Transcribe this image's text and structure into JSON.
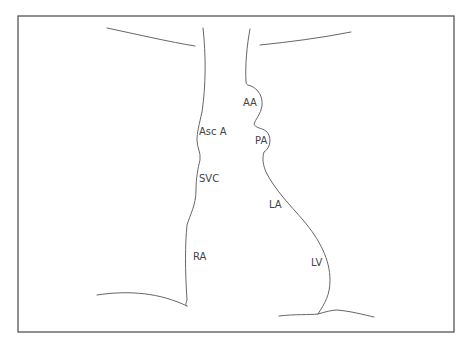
{
  "diagram": {
    "type": "cardiac silhouette outline (chest radiograph schematic)",
    "colors": {
      "line": "#666666",
      "frame": "#555555",
      "text": "#444444",
      "background": "#ffffff"
    },
    "labels": [
      {
        "id": "aa",
        "text": "AA",
        "x": 243,
        "y": 98
      },
      {
        "id": "asc-a",
        "text": "Asc A",
        "x": 199,
        "y": 127
      },
      {
        "id": "pa",
        "text": "PA",
        "x": 255,
        "y": 136
      },
      {
        "id": "svc",
        "text": "SVC",
        "x": 199,
        "y": 174
      },
      {
        "id": "la",
        "text": "LA",
        "x": 269,
        "y": 200
      },
      {
        "id": "ra",
        "text": "RA",
        "x": 193,
        "y": 252
      },
      {
        "id": "lv",
        "text": "LV",
        "x": 311,
        "y": 258
      }
    ]
  }
}
